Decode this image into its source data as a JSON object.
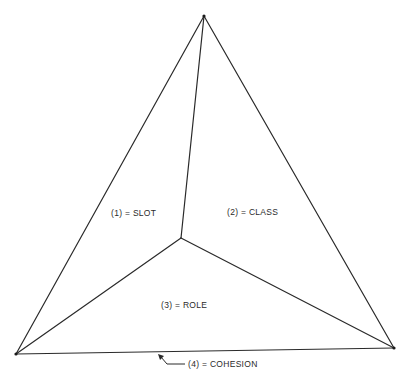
{
  "diagram": {
    "type": "triangular-pyramid",
    "vertices": {
      "apex": {
        "x": 204,
        "y": 16
      },
      "bottom_left": {
        "x": 16,
        "y": 354
      },
      "bottom_right": {
        "x": 394,
        "y": 348
      },
      "center": {
        "x": 181,
        "y": 238
      }
    },
    "faces": [
      {
        "id": 1,
        "label": "(1) = SLOT",
        "x": 111,
        "y": 216
      },
      {
        "id": 2,
        "label": "(2) = CLASS",
        "x": 227,
        "y": 215
      },
      {
        "id": 3,
        "label": "(3) = ROLE",
        "x": 161,
        "y": 308
      }
    ],
    "base": {
      "id": 4,
      "label": "(4) = COHESION",
      "x": 188,
      "y": 367
    },
    "colors": {
      "line": "#2a2a2a",
      "text": "#2a2a2a",
      "background": "#ffffff"
    }
  }
}
